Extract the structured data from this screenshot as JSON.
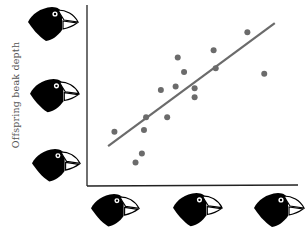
{
  "chart_data": {
    "type": "scatter",
    "title": "",
    "xlabel": "Parent beak depth (illustrated by finch heads)",
    "ylabel": "Offspring beak depth",
    "x_tick_icons": [
      "finch-head-small-beak",
      "finch-head-medium-beak",
      "finch-head-large-beak"
    ],
    "y_tick_icons": [
      "finch-head-large-beak",
      "finch-head-medium-beak",
      "finch-head-small-beak"
    ],
    "grid": false,
    "legend": null,
    "xlim": [
      0,
      100
    ],
    "ylim": [
      0,
      100
    ],
    "points": [
      {
        "x": 13,
        "y": 30
      },
      {
        "x": 23,
        "y": 13
      },
      {
        "x": 26,
        "y": 18
      },
      {
        "x": 27,
        "y": 31
      },
      {
        "x": 28,
        "y": 38
      },
      {
        "x": 35,
        "y": 53
      },
      {
        "x": 38,
        "y": 38
      },
      {
        "x": 43,
        "y": 71
      },
      {
        "x": 42,
        "y": 55
      },
      {
        "x": 46,
        "y": 63
      },
      {
        "x": 51,
        "y": 54
      },
      {
        "x": 51,
        "y": 49
      },
      {
        "x": 60,
        "y": 75
      },
      {
        "x": 61,
        "y": 65
      },
      {
        "x": 76,
        "y": 85
      },
      {
        "x": 84,
        "y": 62
      }
    ],
    "trendline": {
      "x0": 10,
      "y0": 22,
      "x1": 89,
      "y1": 90
    },
    "colors": {
      "points": "#6b6b6b",
      "line": "#6b6b6b",
      "axes": "#222222",
      "bird": "#000000"
    }
  },
  "axis": {
    "ylabel": "Offspring beak depth"
  }
}
